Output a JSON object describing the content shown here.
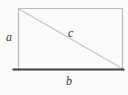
{
  "figure": {
    "type": "rectangle-with-diagonal-diagram",
    "labels": {
      "left_side": "a",
      "bottom_side": "b",
      "diagonal": "c"
    },
    "colors": {
      "light_edge": "#b9bcbc",
      "diagonal_line": "#c3c6c6",
      "bottom_edge": "#3d4040",
      "background": "#fbfbfa",
      "label_text": "#3a3a3a"
    }
  }
}
